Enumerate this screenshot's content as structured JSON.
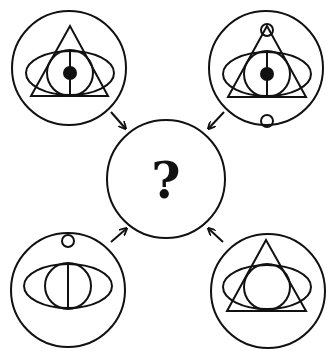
{
  "puzzle": {
    "type": "figure-composition",
    "center": {
      "label": "?",
      "description": "unknown figure to determine"
    },
    "panels": [
      {
        "position": "top-left",
        "elements": [
          "outer-circle",
          "triangle",
          "ellipse",
          "inner-circle",
          "vertical-line",
          "black-dot"
        ]
      },
      {
        "position": "top-right",
        "elements": [
          "outer-circle",
          "triangle",
          "ellipse",
          "inner-circle",
          "vertical-line",
          "black-dot",
          "small-circle-top-apex",
          "small-circle-bottom"
        ]
      },
      {
        "position": "bottom-left",
        "elements": [
          "outer-circle",
          "ellipse",
          "inner-circle",
          "vertical-line",
          "small-circle-top"
        ]
      },
      {
        "position": "bottom-right",
        "elements": [
          "outer-circle",
          "triangle",
          "ellipse",
          "inner-circle"
        ]
      }
    ],
    "arrows": [
      "top-left-to-center",
      "top-right-to-center",
      "bottom-left-to-center",
      "bottom-right-to-center"
    ]
  },
  "colors": {
    "line": "#111111",
    "background": "#ffffff"
  }
}
